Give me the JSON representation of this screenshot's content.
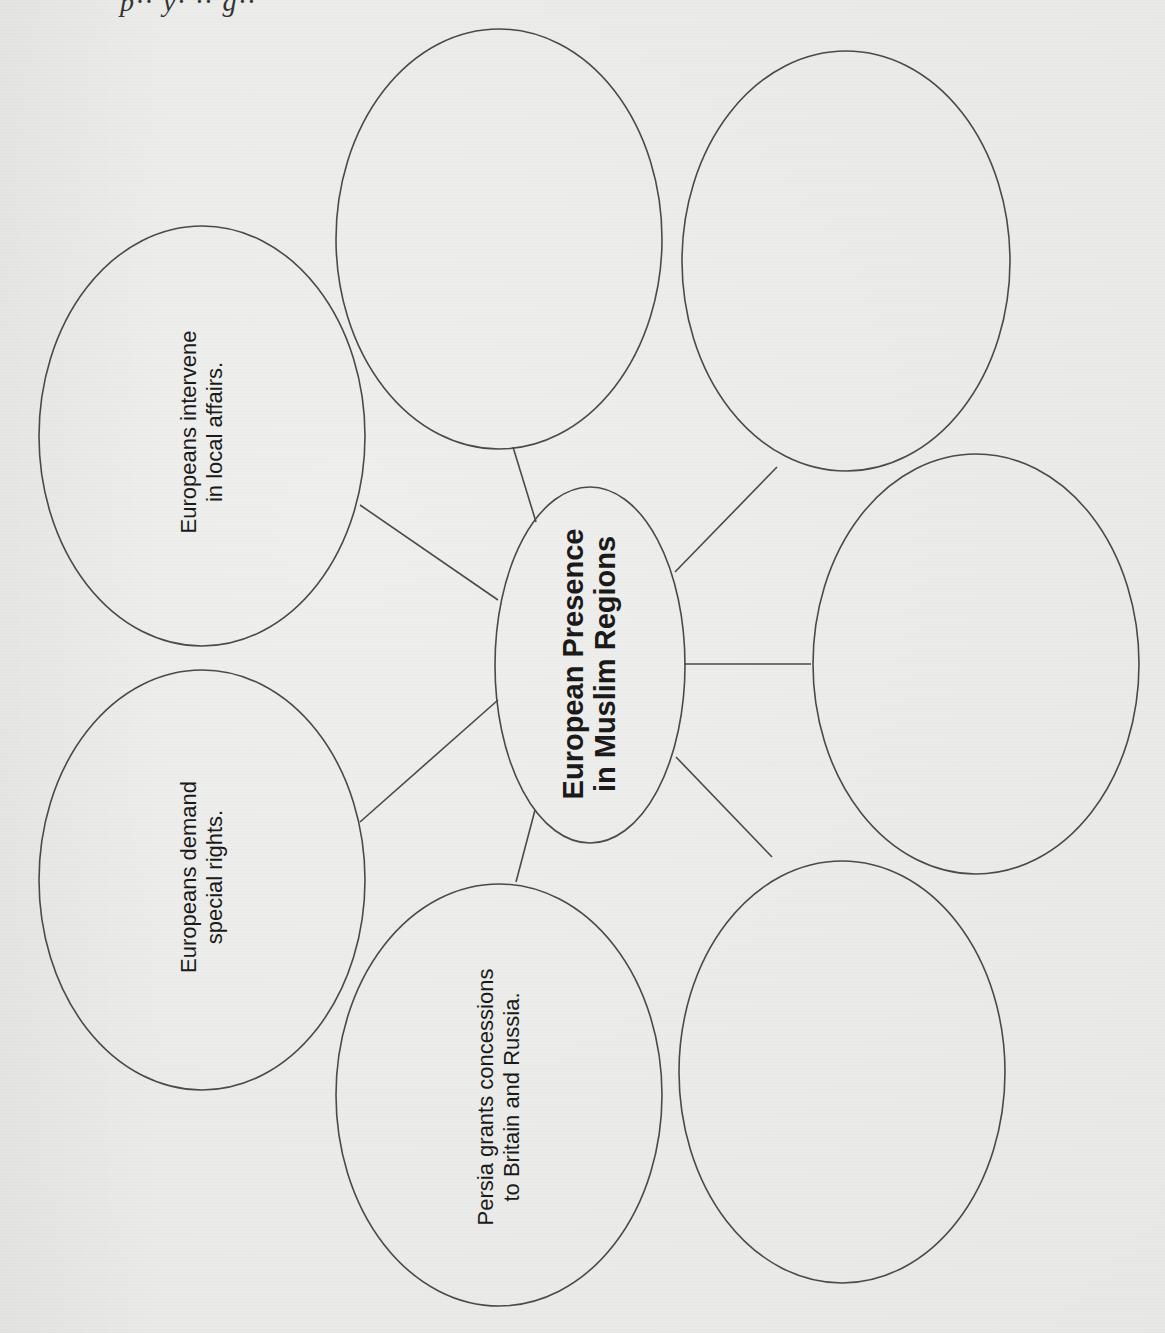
{
  "page": {
    "header_fragment": "p·· y· ·· g··"
  },
  "diagram": {
    "type": "web-organizer",
    "orientation": "rotated-90-ccw",
    "stroke_color": "#4a4a4a",
    "background_color": "#ececea",
    "center": {
      "line1": "European Presence",
      "line2": "in Muslim Regions"
    },
    "nodes": [
      {
        "id": "intervene",
        "line1": "Europeans intervene",
        "line2": "in local affairs.",
        "filled": true
      },
      {
        "id": "demand",
        "line1": "Europeans demand",
        "line2": "special rights.",
        "filled": true
      },
      {
        "id": "persia",
        "line1": "Persia grants concessions",
        "line2": "to Britain and Russia.",
        "filled": true
      },
      {
        "id": "blank-top-left",
        "line1": "",
        "line2": "",
        "filled": false
      },
      {
        "id": "blank-top-right",
        "line1": "",
        "line2": "",
        "filled": false
      },
      {
        "id": "blank-right",
        "line1": "",
        "line2": "",
        "filled": false
      },
      {
        "id": "blank-bottom-right",
        "line1": "",
        "line2": "",
        "filled": false
      }
    ]
  }
}
